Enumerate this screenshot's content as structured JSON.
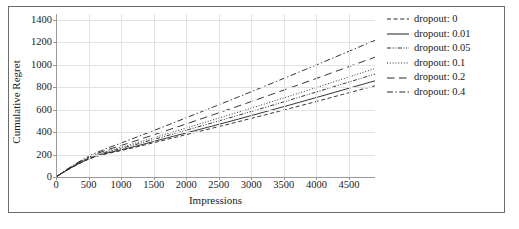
{
  "chart_data": {
    "type": "line",
    "title": "",
    "xlabel": "Impressions",
    "ylabel": "Cumulative Regret",
    "xlim": [
      0,
      4900
    ],
    "ylim": [
      0,
      1450
    ],
    "xticks": [
      0,
      500,
      1000,
      1500,
      2000,
      2500,
      3000,
      3500,
      4000,
      4500
    ],
    "yticks": [
      0,
      200,
      400,
      600,
      800,
      1000,
      1200,
      1400
    ],
    "grid": true,
    "legend_position": "right",
    "x": [
      0,
      100,
      200,
      300,
      400,
      500,
      600,
      700,
      800,
      1000,
      1200,
      1500,
      1800,
      2000,
      2400,
      2800,
      3200,
      3600,
      4000,
      4400,
      4900
    ],
    "series": [
      {
        "name": "dropout: 0",
        "label": "dropout: 0",
        "style": "dashed",
        "values": [
          0,
          36,
          70,
          101,
          131,
          158,
          180,
          196,
          210,
          235,
          262,
          305,
          348,
          377,
          434,
          492,
          551,
          611,
          672,
          734,
          812
        ]
      },
      {
        "name": "dropout: 0.01",
        "label": "dropout: 0.01",
        "style": "solid",
        "values": [
          0,
          37,
          72,
          104,
          134,
          162,
          184,
          200,
          215,
          242,
          270,
          316,
          362,
          392,
          453,
          515,
          578,
          642,
          707,
          773,
          856
        ]
      },
      {
        "name": "dropout: 0.05",
        "label": "dropout: 0.05",
        "style": "dashdotdot",
        "values": [
          0,
          38,
          74,
          107,
          138,
          166,
          190,
          208,
          224,
          254,
          285,
          334,
          383,
          416,
          482,
          549,
          617,
          686,
          756,
          827,
          916
        ]
      },
      {
        "name": "dropout: 0.1",
        "label": "dropout: 0.1",
        "style": "dotted",
        "values": [
          0,
          39,
          76,
          110,
          142,
          171,
          196,
          215,
          232,
          264,
          297,
          349,
          401,
          436,
          506,
          577,
          649,
          722,
          796,
          871,
          965
        ]
      },
      {
        "name": "dropout: 0.2",
        "label": "dropout: 0.2",
        "style": "longdash",
        "values": [
          0,
          40,
          78,
          113,
          146,
          176,
          203,
          224,
          244,
          280,
          317,
          375,
          433,
          472,
          551,
          631,
          712,
          794,
          877,
          961,
          1066
        ]
      },
      {
        "name": "dropout: 0.4",
        "label": "dropout: 0.4",
        "style": "dashdot",
        "values": [
          0,
          41,
          80,
          117,
          151,
          183,
          212,
          236,
          259,
          302,
          346,
          413,
          481,
          527,
          619,
          712,
          806,
          901,
          997,
          1094,
          1216
        ]
      }
    ],
    "colors": {
      "line": "#2b2b2b",
      "grid": "#e2e2e2",
      "axis": "#9a9a9a",
      "frame": "#6b6b6b",
      "background": "#ffffff"
    }
  }
}
